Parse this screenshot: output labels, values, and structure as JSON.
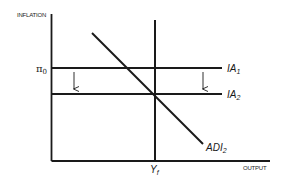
{
  "diagram": {
    "y_axis_label": "INFLATION",
    "x_axis_label": "OUTPUT",
    "pi_label": {
      "symbol": "π",
      "subscript": "0"
    },
    "curves": [
      {
        "id": "IA1",
        "name": "IA",
        "subscript": "1",
        "type": "horizontal",
        "level": "π0"
      },
      {
        "id": "IA2",
        "name": "IA",
        "subscript": "2",
        "type": "horizontal",
        "level": "below π0"
      },
      {
        "id": "ADI2",
        "name": "ADI",
        "subscript": "2",
        "type": "downward-sloping"
      },
      {
        "id": "LRAS",
        "name": "Y",
        "subscript": "f",
        "type": "vertical"
      }
    ],
    "arrows": [
      {
        "from": "IA1",
        "to": "IA2",
        "direction": "down",
        "position": "left"
      },
      {
        "from": "IA1",
        "to": "IA2",
        "direction": "down",
        "position": "right"
      }
    ],
    "colors": {
      "line": "#1a1a1a",
      "background": "#ffffff"
    }
  }
}
